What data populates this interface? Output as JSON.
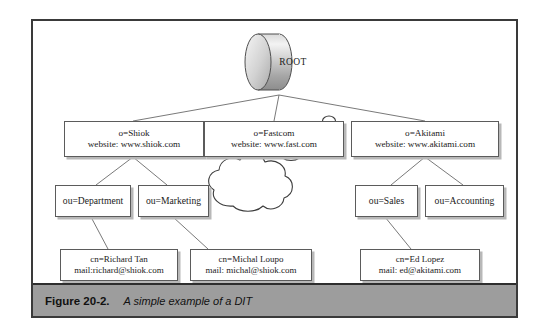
{
  "figure": {
    "caption_number": "Figure 20-2.",
    "caption_text": "A simple example of a DIT",
    "frame_border_color": "#3a3a3a",
    "caption_bar_color": "#9d9d9d",
    "page_background": "#ffffff"
  },
  "diagram": {
    "type": "tree",
    "root": {
      "label": "ROOT",
      "shape": "cylinder"
    },
    "organizations": [
      {
        "name": "o=Shiok",
        "website": "website: www.shiok.com",
        "units": [
          {
            "name": "ou=Department",
            "entries": [
              {
                "cn": "cn=Richard Tan",
                "mail": "mail:richard@shiok.com"
              }
            ]
          },
          {
            "name": "ou=Marketing",
            "entries": [
              {
                "cn": "cn=Michal Loupo",
                "mail": "mail: michal@shiok.com"
              }
            ]
          }
        ]
      },
      {
        "name": "o=Fastcom",
        "website": "website: www.fast.com",
        "units": [],
        "annotation": "cloud"
      },
      {
        "name": "o=Akitami",
        "website": "website: www.akitami.com",
        "units": [
          {
            "name": "ou=Sales",
            "entries": [
              {
                "cn": "cn=Ed Lopez",
                "mail": "mail: ed@akitami.com"
              }
            ]
          },
          {
            "name": "ou=Accounting",
            "entries": []
          }
        ]
      }
    ],
    "line_color": "#6a6a6a",
    "box_border_color": "#5b5b5b",
    "box_shadow_color": "#b8b8b8"
  }
}
